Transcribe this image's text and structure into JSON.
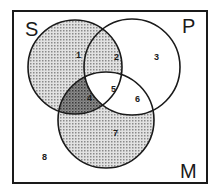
{
  "diagram": {
    "type": "venn",
    "sets": [
      {
        "name": "S",
        "label": "S"
      },
      {
        "name": "P",
        "label": "P"
      },
      {
        "name": "M",
        "label": "M"
      }
    ],
    "regions": [
      {
        "id": "1",
        "label": "1",
        "membership": "S only",
        "shaded": "light"
      },
      {
        "id": "2",
        "label": "2",
        "membership": "S and P, not M",
        "shaded": "light"
      },
      {
        "id": "3",
        "label": "3",
        "membership": "P only",
        "shaded": "none"
      },
      {
        "id": "4",
        "label": "4",
        "membership": "S and M, not P",
        "shaded": "dark"
      },
      {
        "id": "5",
        "label": "5",
        "membership": "S, P and M",
        "shaded": "none"
      },
      {
        "id": "6",
        "label": "6",
        "membership": "P and M, not S",
        "shaded": "none"
      },
      {
        "id": "7",
        "label": "7",
        "membership": "M only",
        "shaded": "light"
      },
      {
        "id": "8",
        "label": "8",
        "membership": "outside all sets",
        "shaded": "none"
      }
    ],
    "colors": {
      "stroke": "#1a1a1a",
      "light_shade": "#b8b8b8",
      "dark_shade": "#6e6e6e",
      "background": "#ffffff"
    }
  }
}
